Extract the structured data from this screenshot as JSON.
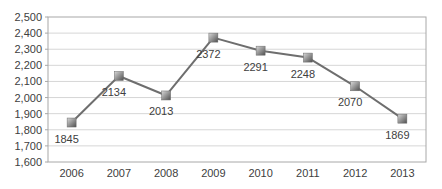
{
  "chart_data": {
    "type": "line",
    "title": "",
    "xlabel": "",
    "ylabel": "",
    "categories": [
      "2006",
      "2007",
      "2008",
      "2009",
      "2010",
      "2011",
      "2012",
      "2013"
    ],
    "series": [
      {
        "name": "value",
        "values": [
          1845,
          2134,
          2013,
          2372,
          2291,
          2248,
          2070,
          1869
        ]
      }
    ],
    "data_labels": [
      1845,
      2134,
      2013,
      2372,
      2291,
      2248,
      2070,
      1869
    ],
    "ylim": [
      1600,
      2500
    ],
    "ytick_step": 100,
    "ytick_labels": [
      "1,600",
      "1,700",
      "1,800",
      "1,900",
      "2,000",
      "2,100",
      "2,200",
      "2,300",
      "2,400",
      "2,500"
    ],
    "grid": true,
    "legend_position": "none",
    "marker_shape": "square",
    "colors": {
      "line": "#6e6e6e",
      "marker_light": "#d9d9d9",
      "marker_dark": "#4f4f4f",
      "marker_stroke": "#6a6a6a",
      "grid": "#d6d6d6",
      "frame": "#a8a8a8",
      "text": "#404040",
      "background": "#ffffff"
    }
  }
}
